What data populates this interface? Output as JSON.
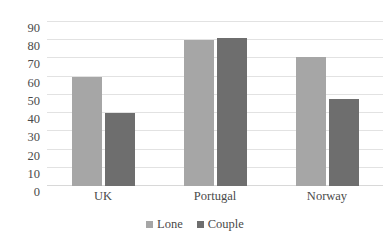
{
  "chart_data": {
    "type": "bar",
    "title": "",
    "subtitle": "",
    "xlabel": "",
    "ylabel": "",
    "categories": [
      "UK",
      "Portugal",
      "Norway"
    ],
    "series": [
      {
        "name": "Lone",
        "values": [
          60,
          80,
          71
        ],
        "color": "#a6a6a6"
      },
      {
        "name": "Couple",
        "values": [
          40,
          81,
          48
        ],
        "color": "#6e6e6e"
      }
    ],
    "ylim": [
      0,
      90
    ],
    "ytick_step": 10,
    "yticks": [
      90,
      80,
      70,
      60,
      50,
      40,
      30,
      20,
      10,
      0
    ],
    "ytick_labels": [
      "90",
      "80",
      "70",
      "60",
      "50",
      "40",
      "30",
      "20",
      "10",
      "0"
    ],
    "grid": true,
    "grid_axis": "y",
    "grid_color": "#e2e2e2",
    "legend_position": "bottom",
    "background_color": "#ffffff"
  }
}
